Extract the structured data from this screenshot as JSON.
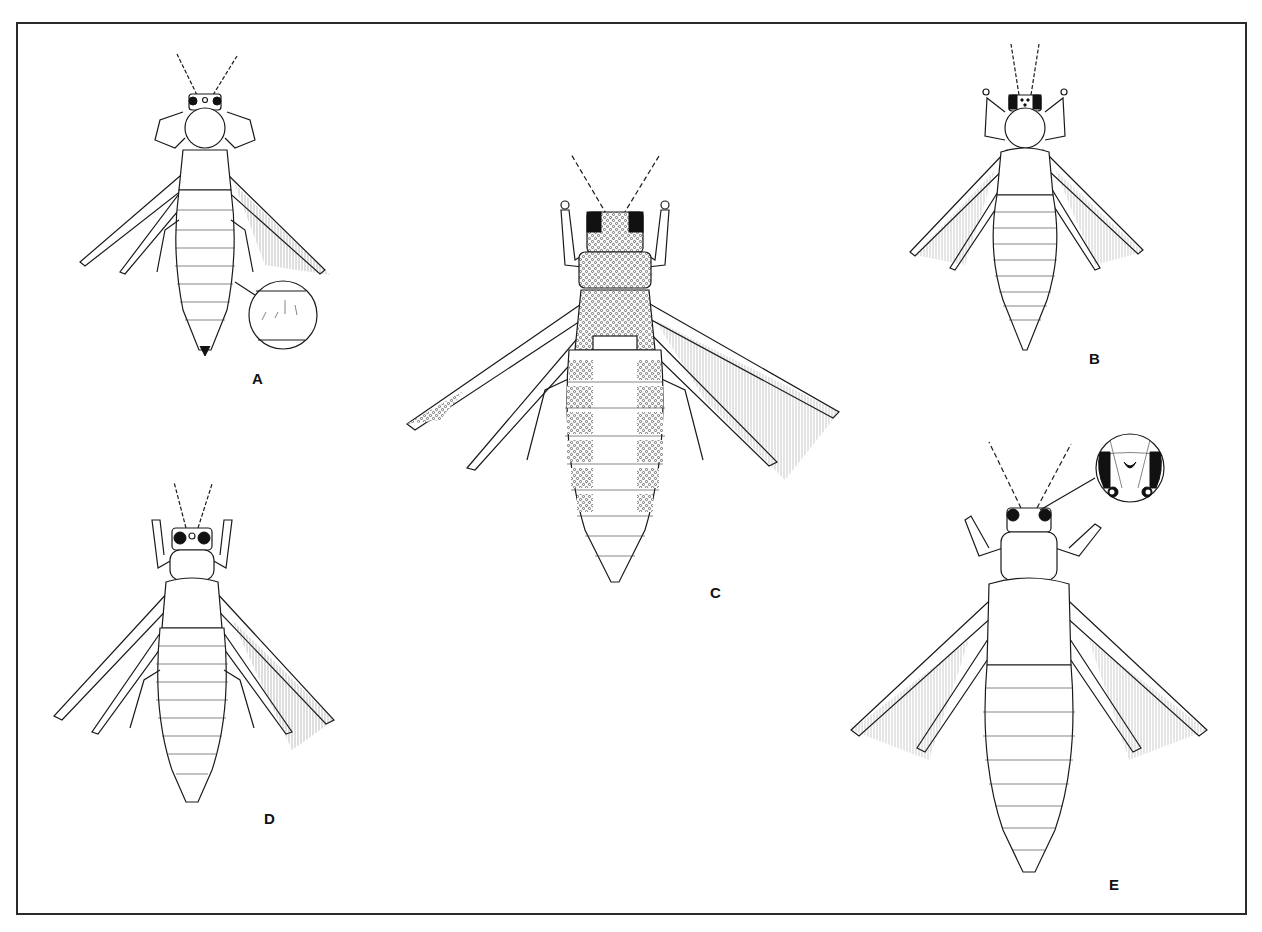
{
  "plate": {
    "description": "Scientific illustration plate of five winged thrips (dorsal view)",
    "border_color": "#2a2a2a",
    "background": "#ffffff",
    "ink_color": "#1a1a1a"
  },
  "figures": [
    {
      "id": "A",
      "label": "A",
      "inset": "abdominal tergite texture magnified"
    },
    {
      "id": "B",
      "label": "B",
      "inset": ""
    },
    {
      "id": "C",
      "label": "C",
      "inset": "",
      "note": "heavily stippled/reticulate body"
    },
    {
      "id": "D",
      "label": "D",
      "inset": ""
    },
    {
      "id": "E",
      "label": "E",
      "inset": "head with ocelli magnified"
    }
  ]
}
